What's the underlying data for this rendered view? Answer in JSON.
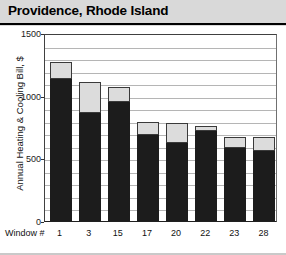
{
  "title": "Providence, Rhode Island",
  "axis": {
    "y_label": "Annual Heating & Cooling Bill, $",
    "x_caption": "Window #"
  },
  "chart_data": {
    "type": "bar",
    "title": "Providence, Rhode Island",
    "subtitle": "",
    "stacked": true,
    "xlabel": "Window #",
    "ylabel": "Annual Heating & Cooling Bill, $",
    "categories": [
      "1",
      "3",
      "15",
      "17",
      "20",
      "22",
      "23",
      "28"
    ],
    "ylim": [
      0,
      1500
    ],
    "yticks": [
      0,
      500,
      1000,
      1500
    ],
    "ytick_labels": [
      "0",
      "500",
      "1000",
      "1500"
    ],
    "grid": true,
    "grid_interval": 100,
    "legend": "none",
    "series": [
      {
        "name": "Heating",
        "color": "#1c1c1c",
        "values": [
          1130,
          860,
          950,
          690,
          620,
          720,
          580,
          560
        ]
      },
      {
        "name": "Cooling",
        "color": "#dcdcdc",
        "values": [
          140,
          250,
          120,
          100,
          160,
          40,
          90,
          110
        ]
      }
    ],
    "totals": [
      1270,
      1110,
      1070,
      790,
      780,
      760,
      670,
      670
    ]
  },
  "colors": {
    "title_band": "#d9d9d9",
    "plot_background": "#ffffff",
    "gridline": "#b5b5b5",
    "bar_dark": "#1c1c1c",
    "bar_light": "#dcdcdc",
    "text": "#111111"
  }
}
